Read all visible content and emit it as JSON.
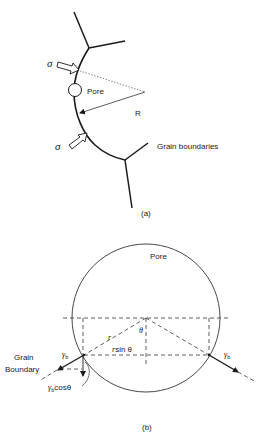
{
  "panel_a": {
    "caption": "(a)",
    "labels": {
      "stress_top": "σ",
      "stress_bottom": "σ",
      "pore": "Pore",
      "radius": "R",
      "grain_boundaries": "Grain boundaries"
    }
  },
  "panel_b": {
    "caption": "(b)",
    "labels": {
      "pore": "Pore",
      "theta": "θ",
      "r": "r",
      "r_sin_theta_r": "r",
      "r_sin_theta_rest": "sin θ",
      "grain_boundary_line1": "Grain",
      "grain_boundary_line2": "Boundary",
      "gamma_left": "γ",
      "gamma_left_sub": "b",
      "gamma_right": "γ",
      "gamma_right_sub": "b",
      "gamma_cos_gamma": "γ",
      "gamma_cos_sub": "b",
      "gamma_cos_rest": "cosθ"
    }
  },
  "colors": {
    "ink": "#1a1a1a",
    "thin": "#333333",
    "background": "#ffffff"
  }
}
